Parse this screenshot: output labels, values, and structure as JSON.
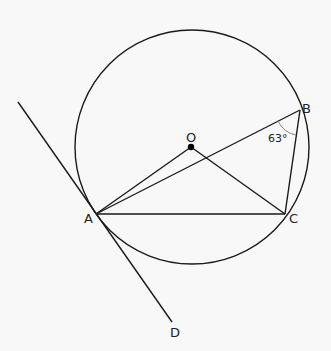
{
  "diagram": {
    "type": "circle-geometry",
    "circle": {
      "center_label": "O",
      "cx": 192,
      "cy": 147,
      "r": 117
    },
    "points": {
      "O": {
        "label": "O",
        "x": 191,
        "y": 147
      },
      "A": {
        "label": "A",
        "x": 96,
        "y": 214
      },
      "B": {
        "label": "B",
        "x": 300,
        "y": 110
      },
      "C": {
        "label": "C",
        "x": 285,
        "y": 214
      },
      "D": {
        "label": "D",
        "x": 172,
        "y": 322
      }
    },
    "segments": [
      "OA",
      "OC",
      "AB",
      "AC",
      "BC",
      "AD tangent"
    ],
    "angle_annotation": {
      "vertex": "B",
      "between": "AB,BC",
      "label": "63°"
    },
    "colors": {
      "stroke": "#1a1a1a",
      "background": "#f8f8f8"
    }
  }
}
